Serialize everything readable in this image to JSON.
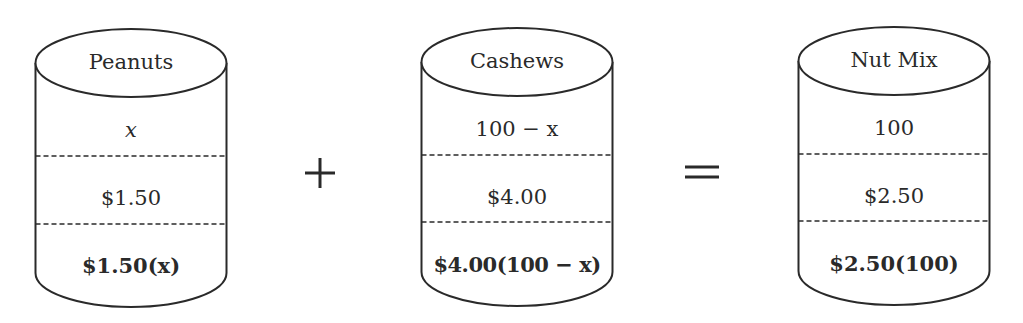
{
  "cylinders": [
    {
      "label": "Peanuts",
      "quantity": "x",
      "price": "$1.50",
      "total": "$1.50(x)"
    },
    {
      "label": "Cashews",
      "quantity": "100 − x",
      "price": "$4.00",
      "total": "$4.00(100 − x)"
    },
    {
      "label": "Nut Mix",
      "quantity": "100",
      "price": "$2.50",
      "total": "$2.50(100)"
    }
  ],
  "operators": {
    "plus": "+",
    "equals": "="
  },
  "colors": {
    "stroke": "#2a2a2a",
    "background": "#ffffff"
  }
}
